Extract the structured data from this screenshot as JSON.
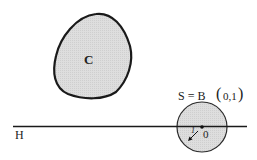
{
  "figure": {
    "convex_set_label": "C",
    "sphere_label": "S = B(0,1)",
    "sphere_label_parts": {
      "prefix": "S = B",
      "args": "0,1"
    },
    "hyperplane_label": "H",
    "center_label": "0",
    "radius_label": "1",
    "colors": {
      "fill": "#dcdcdc",
      "stroke": "#1a1a1a"
    }
  }
}
